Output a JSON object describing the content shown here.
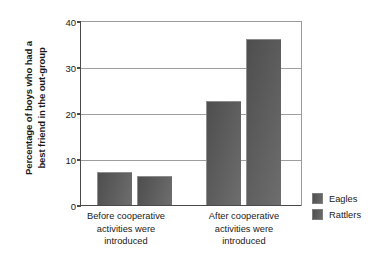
{
  "chart_data": {
    "type": "bar",
    "title": "",
    "xlabel": "",
    "ylabel_line1": "Percentage of boys who had a",
    "ylabel_line2": "best friend in the out-group",
    "categories": [
      "Before cooperative activities were introduced",
      "After cooperative activities were introduced"
    ],
    "category_lines": [
      [
        "Before cooperative",
        "activities were",
        "introduced"
      ],
      [
        "After cooperative",
        "activities were",
        "introduced"
      ]
    ],
    "series": [
      {
        "name": "Eagles",
        "values": [
          7.2,
          22.6
        ],
        "color": "#5c5c5c"
      },
      {
        "name": "Rattlers",
        "values": [
          6.3,
          36.0
        ],
        "color": "#5c5c5c"
      }
    ],
    "ylim": [
      0,
      40
    ],
    "yticks": [
      0,
      10,
      20,
      30,
      40
    ],
    "ytick_labels": [
      "0",
      "10",
      "20",
      "30",
      "40"
    ],
    "grid": true,
    "legend_position": "right"
  }
}
